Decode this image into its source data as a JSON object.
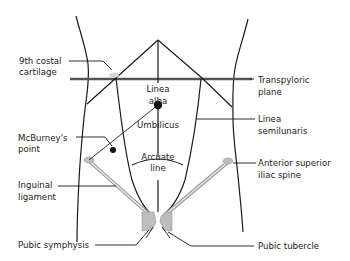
{
  "diagram": {
    "labels": {
      "costal_cartilage": [
        "9th costal",
        "cartilage"
      ],
      "transpyloric_plane": [
        "Transpyloric",
        "plane"
      ],
      "linea_alba": [
        "Linea",
        "alba"
      ],
      "umbilicus": "Umbilicus",
      "linea_semilunaris": [
        "Linea",
        "semilunaris"
      ],
      "mcburneys_point": [
        "McBurney's",
        "point"
      ],
      "arcuate_line": [
        "Arcuate",
        "line"
      ],
      "asis": [
        "Anterior superior",
        "iliac spine"
      ],
      "inguinal_ligament": [
        "Inguinal",
        "ligament"
      ],
      "pubic_symphysis": "Pubic symphysis",
      "pubic_tubercle": "Pubic tubercle"
    },
    "colors": {
      "line": "#1a1a1a",
      "plane": "#555555",
      "ligament": "#9a9a9a",
      "bone": "#bdbdbd",
      "text": "#222222"
    }
  }
}
